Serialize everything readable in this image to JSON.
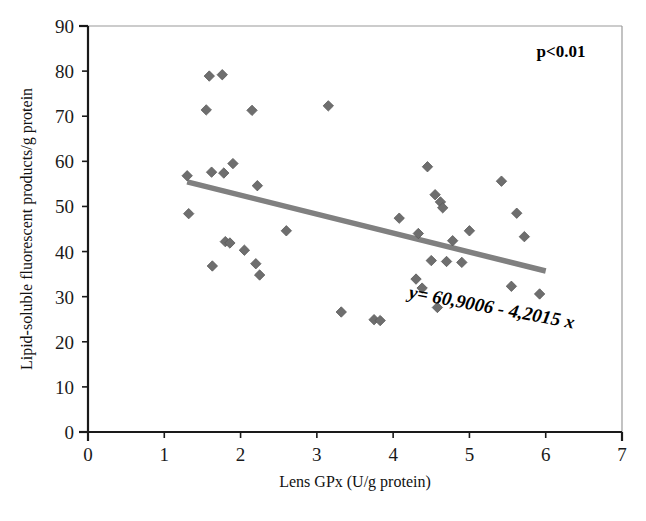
{
  "chart_data": {
    "type": "scatter",
    "title": "",
    "xlabel": "Lens GPx (U/g protein)",
    "ylabel": "Lipid-soluble fluorescent products/g protein",
    "xlim": [
      0,
      7
    ],
    "ylim": [
      0,
      90
    ],
    "xticks": [
      "0",
      "1",
      "2",
      "3",
      "4",
      "5",
      "6",
      "7"
    ],
    "yticks": [
      "0",
      "10",
      "20",
      "30",
      "40",
      "50",
      "60",
      "70",
      "80",
      "90"
    ],
    "xtick_values": [
      0,
      1,
      2,
      3,
      4,
      5,
      6,
      7
    ],
    "ytick_values": [
      0,
      10,
      20,
      30,
      40,
      50,
      60,
      70,
      80,
      90
    ],
    "grid": false,
    "legend": "none",
    "marker": "diamond",
    "marker_color": "#6e6e6e",
    "line_color": "#808080",
    "annotations": [
      {
        "name": "p-value",
        "text": "p<0.01",
        "x": 6.1,
        "y": 85.5
      },
      {
        "name": "regression-equation",
        "text": "y= 60,9006 - 4,2015 x",
        "x": 4.35,
        "y": 29.5
      }
    ],
    "trendline": {
      "equation": "y = 60,9006 - 4,2015 x",
      "intercept": 60.9006,
      "slope": -4.2015,
      "x_start": 1.3,
      "x_end": 6.0,
      "y_start": 55.44,
      "y_end": 35.69
    },
    "points": [
      {
        "x": 1.3,
        "y": 56.8
      },
      {
        "x": 1.32,
        "y": 48.4
      },
      {
        "x": 1.55,
        "y": 71.4
      },
      {
        "x": 1.59,
        "y": 78.9
      },
      {
        "x": 1.62,
        "y": 57.6
      },
      {
        "x": 1.63,
        "y": 36.8
      },
      {
        "x": 1.76,
        "y": 79.2
      },
      {
        "x": 1.78,
        "y": 57.4
      },
      {
        "x": 1.8,
        "y": 42.2
      },
      {
        "x": 1.86,
        "y": 41.9
      },
      {
        "x": 1.9,
        "y": 59.5
      },
      {
        "x": 2.05,
        "y": 40.3
      },
      {
        "x": 2.15,
        "y": 71.3
      },
      {
        "x": 2.2,
        "y": 37.3
      },
      {
        "x": 2.22,
        "y": 54.6
      },
      {
        "x": 2.25,
        "y": 34.8
      },
      {
        "x": 2.6,
        "y": 44.6
      },
      {
        "x": 3.15,
        "y": 72.3
      },
      {
        "x": 3.32,
        "y": 26.6
      },
      {
        "x": 3.75,
        "y": 24.9
      },
      {
        "x": 3.83,
        "y": 24.7
      },
      {
        "x": 4.08,
        "y": 47.4
      },
      {
        "x": 4.3,
        "y": 33.9
      },
      {
        "x": 4.33,
        "y": 44.0
      },
      {
        "x": 4.38,
        "y": 31.9
      },
      {
        "x": 4.45,
        "y": 58.8
      },
      {
        "x": 4.5,
        "y": 38.0
      },
      {
        "x": 4.55,
        "y": 52.6
      },
      {
        "x": 4.58,
        "y": 27.6
      },
      {
        "x": 4.62,
        "y": 51.0
      },
      {
        "x": 4.65,
        "y": 49.7
      },
      {
        "x": 4.7,
        "y": 37.8
      },
      {
        "x": 4.78,
        "y": 42.4
      },
      {
        "x": 4.9,
        "y": 37.6
      },
      {
        "x": 5.0,
        "y": 44.6
      },
      {
        "x": 5.42,
        "y": 55.6
      },
      {
        "x": 5.55,
        "y": 32.3
      },
      {
        "x": 5.62,
        "y": 48.5
      },
      {
        "x": 5.72,
        "y": 43.3
      },
      {
        "x": 5.92,
        "y": 30.6
      }
    ]
  },
  "figure": {
    "caption": "",
    "background": "#ffffff"
  }
}
